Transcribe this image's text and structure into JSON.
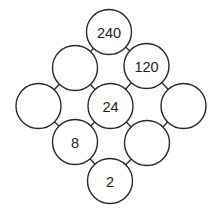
{
  "diagram": {
    "type": "number-circle-puzzle",
    "nodes": [
      {
        "id": "top",
        "label": "240",
        "cx": 109,
        "cy": 32
      },
      {
        "id": "upper-left",
        "label": "",
        "cx": 75,
        "cy": 68
      },
      {
        "id": "upper-right",
        "label": "120",
        "cx": 146.5,
        "cy": 66
      },
      {
        "id": "left",
        "label": "",
        "cx": 38.5,
        "cy": 106
      },
      {
        "id": "center",
        "label": "24",
        "cx": 110.5,
        "cy": 106
      },
      {
        "id": "right",
        "label": "",
        "cx": 183.5,
        "cy": 106
      },
      {
        "id": "lower-left",
        "label": "8",
        "cx": 75,
        "cy": 142
      },
      {
        "id": "lower-right",
        "label": "",
        "cx": 147,
        "cy": 143
      },
      {
        "id": "bottom",
        "label": "2",
        "cx": 110,
        "cy": 181
      }
    ],
    "edges": [
      [
        "top",
        "upper-left"
      ],
      [
        "top",
        "upper-right"
      ],
      [
        "upper-left",
        "left"
      ],
      [
        "upper-left",
        "center"
      ],
      [
        "upper-right",
        "center"
      ],
      [
        "upper-right",
        "right"
      ],
      [
        "left",
        "lower-left"
      ],
      [
        "center",
        "lower-left"
      ],
      [
        "center",
        "lower-right"
      ],
      [
        "right",
        "lower-right"
      ],
      [
        "lower-left",
        "bottom"
      ],
      [
        "lower-right",
        "bottom"
      ]
    ],
    "radius": 22.5
  }
}
